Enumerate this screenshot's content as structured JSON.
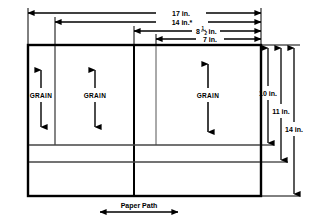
{
  "diagram": {
    "colors": {
      "line": "#000000",
      "thin_line": "#555555",
      "background": "#ffffff"
    },
    "top_dimensions": [
      {
        "id": "d17",
        "label": "17 in.",
        "value": 17,
        "unit": "in.",
        "y": 13,
        "x_start": 28,
        "x_end": 261
      },
      {
        "id": "d14",
        "label": "14 in.*",
        "value": 14,
        "unit": "in.",
        "note": "*",
        "y": 22,
        "x_start": 55,
        "x_end": 261
      },
      {
        "id": "d85",
        "label": "8",
        "fraction_num": "1",
        "fraction_den": "2",
        "label_suffix": " in.",
        "value": 8.5,
        "unit": "in.",
        "y": 31,
        "x_start": 134,
        "x_end": 261
      },
      {
        "id": "d7",
        "label": "7 in.",
        "value": 7,
        "unit": "in.",
        "y": 39,
        "x_start": 156,
        "x_end": 261
      }
    ],
    "right_dimensions": [
      {
        "id": "h10",
        "label": "10 in.",
        "value": 10,
        "unit": "in.",
        "x": 268,
        "y_start": 46,
        "y_end": 145
      },
      {
        "id": "h11",
        "label": "11 in.",
        "value": 11,
        "unit": "in.",
        "x": 281,
        "y_start": 46,
        "y_end": 162
      },
      {
        "id": "h14",
        "label": "14 in.",
        "value": 14,
        "unit": "in.",
        "x": 294,
        "y_start": 46,
        "y_end": 196
      }
    ],
    "grain_columns": [
      {
        "id": "grain-1",
        "label": "GRAIN",
        "cx": 41,
        "arrow_top": 66,
        "arrow_bottom": 130
      },
      {
        "id": "grain-2",
        "label": "GRAIN",
        "cx": 95,
        "arrow_top": 66,
        "arrow_bottom": 130
      },
      {
        "id": "grain-3",
        "label": "GRAIN",
        "cx": 208,
        "arrow_top": 62,
        "arrow_bottom": 134
      }
    ],
    "paper_path": {
      "label": "Paper Path",
      "arrow_left": 100,
      "arrow_right": 178,
      "y": 212,
      "text_y": 206
    },
    "tray": {
      "x": 28,
      "y": 45,
      "width": 233,
      "height": 151
    },
    "inner_verticals": [
      55,
      134,
      156
    ],
    "inner_horizontals": [
      145,
      162
    ]
  }
}
